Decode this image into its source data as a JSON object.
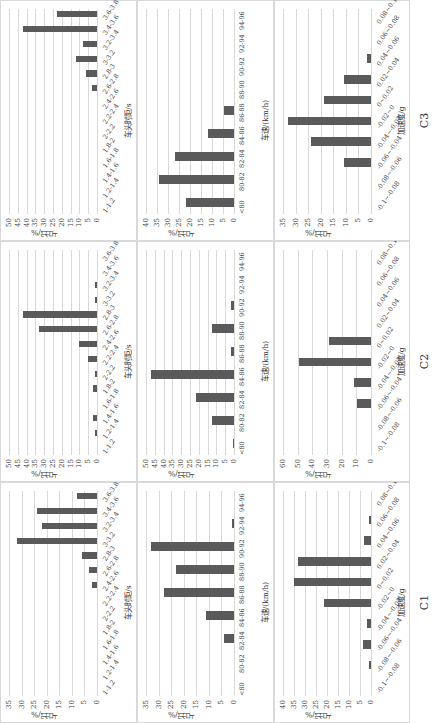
{
  "columns": [
    "C1",
    "C2",
    "C3"
  ],
  "ylabel": "占比/%",
  "rows": {
    "headway": {
      "xlabel": "车头时距/s",
      "categories": [
        "1-1.2",
        "1.2-1.4",
        "1.4-1.6",
        "1.6-1.8",
        "1.8-2",
        "2-2.2",
        "2.2-2.4",
        "2.4-2.6",
        "2.6-2.8",
        "2.8-3",
        "3-3.2",
        "3.2-3.4",
        "3.4-3.6",
        "3.6-3.8"
      ]
    },
    "speed": {
      "xlabel": "车速/(km/h)",
      "categories": [
        "<80",
        "80-82",
        "82-84",
        "84-86",
        "86-88",
        "88-90",
        "90-92",
        "92-94",
        "94-96"
      ]
    },
    "acceleration": {
      "xlabel": "加速度/g",
      "categories": [
        "-0.1~-0.08",
        "-0.08~-0.06",
        "-0.06~-0.04",
        "-0.04~-0.02",
        "-0.02~0",
        "0~0.02",
        "0.02~0.04",
        "0.04~0.06",
        "0.06~0.08",
        "0.08~0.1"
      ]
    }
  },
  "chart_data": [
    {
      "type": "bar",
      "panel": "C1-headway",
      "title": "C1",
      "xlabel": "车头时距/s",
      "ylabel": "占比/%",
      "ylim": [
        0,
        35
      ],
      "yticks": [
        0,
        5,
        10,
        15,
        20,
        25,
        30,
        35
      ],
      "categories": [
        "1-1.2",
        "1.2-1.4",
        "1.4-1.6",
        "1.6-1.8",
        "1.8-2",
        "2-2.2",
        "2.2-2.4",
        "2.4-2.6",
        "2.6-2.8",
        "2.8-3",
        "3-3.2",
        "3.2-3.4",
        "3.4-3.6",
        "3.6-3.8"
      ],
      "values": [
        0,
        0,
        0,
        0,
        0,
        0,
        0,
        2,
        3,
        6,
        32,
        22,
        24,
        8
      ]
    },
    {
      "type": "bar",
      "panel": "C1-speed",
      "title": "C1",
      "xlabel": "车速/(km/h)",
      "ylabel": "占比/%",
      "ylim": [
        0,
        35
      ],
      "yticks": [
        0,
        5,
        10,
        15,
        20,
        25,
        30,
        35
      ],
      "categories": [
        "<80",
        "80-82",
        "82-84",
        "84-86",
        "86-88",
        "88-90",
        "90-92",
        "92-94",
        "94-96"
      ],
      "values": [
        0,
        0,
        4,
        11,
        28,
        23,
        33,
        1,
        0
      ]
    },
    {
      "type": "bar",
      "panel": "C1-acceleration",
      "title": "C1",
      "xlabel": "加速度/g",
      "ylabel": "占比/%",
      "ylim": [
        0,
        40
      ],
      "yticks": [
        0,
        5,
        10,
        15,
        20,
        25,
        30,
        35,
        40
      ],
      "categories": [
        "-0.1~-0.08",
        "-0.08~-0.06",
        "-0.06~-0.04",
        "-0.04~-0.02",
        "-0.02~0",
        "0~0.02",
        "0.02~0.04",
        "0.04~0.06",
        "0.06~0.08",
        "0.08~0.1"
      ],
      "values": [
        0,
        0.8,
        3.8,
        2,
        21.4,
        35,
        33,
        3,
        0.8,
        0
      ]
    },
    {
      "type": "bar",
      "panel": "C2-headway",
      "title": "C2",
      "xlabel": "车头时距/s",
      "ylabel": "占比/%",
      "ylim": [
        0,
        50
      ],
      "yticks": [
        0,
        5,
        10,
        15,
        20,
        25,
        30,
        35,
        40,
        45,
        50
      ],
      "categories": [
        "1-1.2",
        "1.2-1.4",
        "1.4-1.6",
        "1.6-1.8",
        "1.8-2",
        "2-2.2",
        "2.2-2.4",
        "2.4-2.6",
        "2.6-2.8",
        "2.8-3",
        "3-3.2",
        "3.2-3.4",
        "3.4-3.6",
        "3.6-3.8"
      ],
      "values": [
        0,
        1,
        2,
        0,
        2,
        1,
        5,
        10,
        33,
        42,
        1,
        1,
        0,
        0
      ]
    },
    {
      "type": "bar",
      "panel": "C2-speed",
      "title": "C2",
      "xlabel": "车速/(km/h)",
      "ylabel": "占比/%",
      "ylim": [
        0,
        50
      ],
      "yticks": [
        0,
        5,
        10,
        15,
        20,
        25,
        30,
        35,
        40,
        45,
        50
      ],
      "categories": [
        "<80",
        "80-82",
        "82-84",
        "84-86",
        "86-88",
        "88-90",
        "90-92",
        "92-94",
        "94-96"
      ],
      "values": [
        0.5,
        12.5,
        21.7,
        47,
        1.7,
        12.5,
        1.7,
        0,
        0
      ]
    },
    {
      "type": "bar",
      "panel": "C2-acceleration",
      "title": "C2",
      "xlabel": "加速度/g",
      "ylabel": "占比/%",
      "ylim": [
        0,
        60
      ],
      "yticks": [
        0,
        10,
        20,
        30,
        40,
        50,
        60
      ],
      "categories": [
        "-0.1~-0.08",
        "-0.08~-0.06",
        "-0.06~-0.04",
        "-0.04~-0.02",
        "-0.02~0",
        "0~0.02",
        "0.02~0.04",
        "0.04~0.06",
        "0.06~0.08",
        "0.08~0.1"
      ],
      "values": [
        0,
        0,
        9.6,
        11.6,
        49,
        28.4,
        0,
        0,
        0,
        0
      ]
    },
    {
      "type": "bar",
      "panel": "C3-headway",
      "title": "C3",
      "xlabel": "车头时距/s",
      "ylabel": "占比/%",
      "ylim": [
        0,
        50
      ],
      "yticks": [
        0,
        5,
        10,
        15,
        20,
        25,
        30,
        35,
        40,
        45,
        50
      ],
      "categories": [
        "1-1.2",
        "1.2-1.4",
        "1.4-1.6",
        "1.6-1.8",
        "1.8-2",
        "2-2.2",
        "2.2-2.4",
        "2.4-2.6",
        "2.6-2.8",
        "2.8-3",
        "3-3.2",
        "3.2-3.4",
        "3.4-3.6",
        "3.6-3.8"
      ],
      "values": [
        0,
        0,
        0,
        0,
        0,
        0,
        0,
        0,
        3,
        6.5,
        12,
        8,
        42,
        23
      ]
    },
    {
      "type": "bar",
      "panel": "C3-speed",
      "title": "C3",
      "xlabel": "车速/(km/h)",
      "ylabel": "占比/%",
      "ylim": [
        0,
        40
      ],
      "yticks": [
        0,
        5,
        10,
        15,
        20,
        25,
        30,
        35,
        40
      ],
      "categories": [
        "<80",
        "80-82",
        "82-84",
        "84-86",
        "86-88",
        "88-90",
        "90-92",
        "92-94",
        "94-96"
      ],
      "values": [
        21.7,
        34,
        27,
        11.7,
        4.4,
        0,
        0,
        0,
        0
      ]
    },
    {
      "type": "bar",
      "panel": "C3-acceleration",
      "title": "C3",
      "xlabel": "加速度/g",
      "ylabel": "占比/%",
      "ylim": [
        0,
        35
      ],
      "yticks": [
        0,
        5,
        10,
        15,
        20,
        25,
        30,
        35
      ],
      "categories": [
        "-0.1~-0.08",
        "-0.08~-0.06",
        "-0.06~-0.04",
        "-0.04~-0.02",
        "-0.02~0",
        "0~0.02",
        "0.02~0.04",
        "0.04~0.06",
        "0.06~0.08",
        "0.08~0.1"
      ],
      "values": [
        0,
        0,
        10.8,
        24,
        33,
        18.7,
        10.8,
        1.6,
        0,
        0
      ]
    }
  ]
}
